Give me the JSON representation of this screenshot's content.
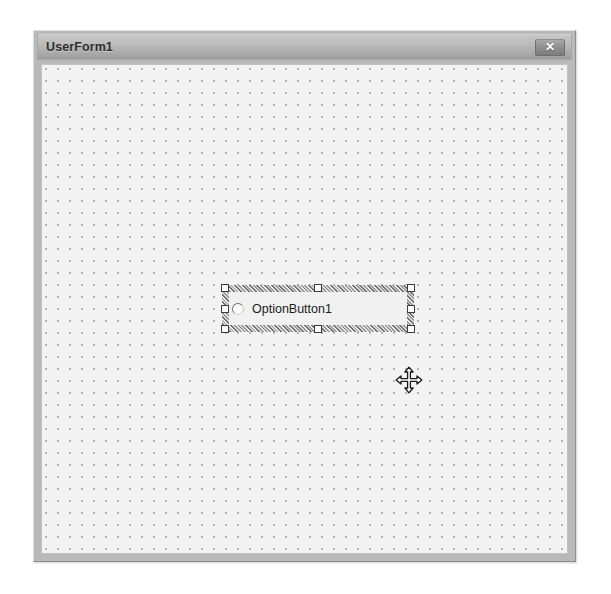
{
  "window": {
    "title": "UserForm1",
    "close_button": {
      "icon": "close-icon",
      "glyph": "✕",
      "tooltip": "Close"
    },
    "frame_color": "#b9b9b9",
    "titlebar_color": "#b0b0b0"
  },
  "form": {
    "background_color": "#f3f3f3",
    "grid": {
      "visible": true,
      "dot_color": "#a9a9a9",
      "spacing_px": 12
    }
  },
  "controls": [
    {
      "type": "OptionButton",
      "name": "OptionButton1",
      "caption": "OptionButton1",
      "selected": true,
      "checked": false,
      "glyph": "radio-button-icon",
      "position": {
        "left": 180,
        "top": 220
      },
      "size": {
        "width": 192,
        "height": 47
      },
      "selection": {
        "border_style": "hatched",
        "handle_count": 8,
        "handle_fill": "#fdfdfd",
        "handle_border": "#3b3b3b",
        "handles": [
          "top-left",
          "top-center",
          "top-right",
          "middle-left",
          "middle-right",
          "bottom-left",
          "bottom-center",
          "bottom-right"
        ]
      }
    }
  ],
  "cursor": {
    "type": "move",
    "icon": "move-cursor-icon",
    "position": {
      "left": 352,
      "top": 300
    }
  }
}
